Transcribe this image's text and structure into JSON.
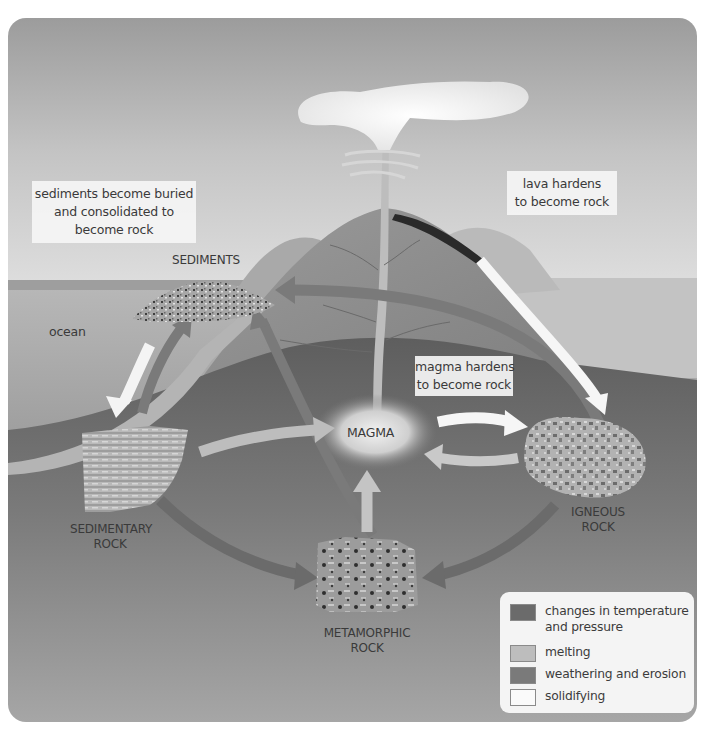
{
  "diagram": {
    "colors": {
      "panel_bg": "#a2a2a2",
      "changes_in_temperature_and_pressure": "#6b6b6b",
      "melting": "#bdbdbd",
      "weathering_and_erosion": "#7a7a7a",
      "solidifying": "#fafafa"
    },
    "labels": {
      "sediments": "SEDIMENTS",
      "ocean": "ocean",
      "magma": "MAGMA",
      "sedimentary_rock": [
        "SEDIMENTARY",
        "ROCK"
      ],
      "igneous_rock": [
        "IGNEOUS",
        "ROCK"
      ],
      "metamorphic_rock": [
        "METAMORPHIC",
        "ROCK"
      ]
    },
    "callouts": {
      "sediments_buried": [
        "sediments become buried",
        "and consolidated to",
        "become rock"
      ],
      "lava_hardens": [
        "lava hardens",
        "to become rock"
      ],
      "magma_hardens": [
        "magma hardens",
        "to become rock"
      ]
    },
    "legend": {
      "items": [
        {
          "label_lines": [
            "changes in temperature",
            "and pressure"
          ],
          "process": "changes in temperature and pressure"
        },
        {
          "label_lines": [
            "melting"
          ],
          "process": "melting"
        },
        {
          "label_lines": [
            "weathering and erosion"
          ],
          "process": "weathering and erosion"
        },
        {
          "label_lines": [
            "solidifying"
          ],
          "process": "solidifying"
        }
      ]
    },
    "processes": [
      {
        "from": "sediments",
        "to": "sedimentary rock",
        "type": "solidifying"
      },
      {
        "from": "sedimentary rock",
        "to": "sediments",
        "type": "weathering and erosion"
      },
      {
        "from": "igneous rock",
        "to": "sediments",
        "type": "weathering and erosion"
      },
      {
        "from": "metamorphic rock",
        "to": "sediments",
        "type": "weathering and erosion"
      },
      {
        "from": "sedimentary rock",
        "to": "magma",
        "type": "melting"
      },
      {
        "from": "metamorphic rock",
        "to": "magma",
        "type": "melting"
      },
      {
        "from": "igneous rock",
        "to": "magma",
        "type": "melting"
      },
      {
        "from": "magma",
        "to": "igneous rock",
        "type": "solidifying"
      },
      {
        "from": "volcano lava",
        "to": "igneous rock",
        "type": "solidifying"
      },
      {
        "from": "sedimentary rock",
        "to": "metamorphic rock",
        "type": "changes in temperature and pressure"
      },
      {
        "from": "igneous rock",
        "to": "metamorphic rock",
        "type": "changes in temperature and pressure"
      }
    ]
  }
}
